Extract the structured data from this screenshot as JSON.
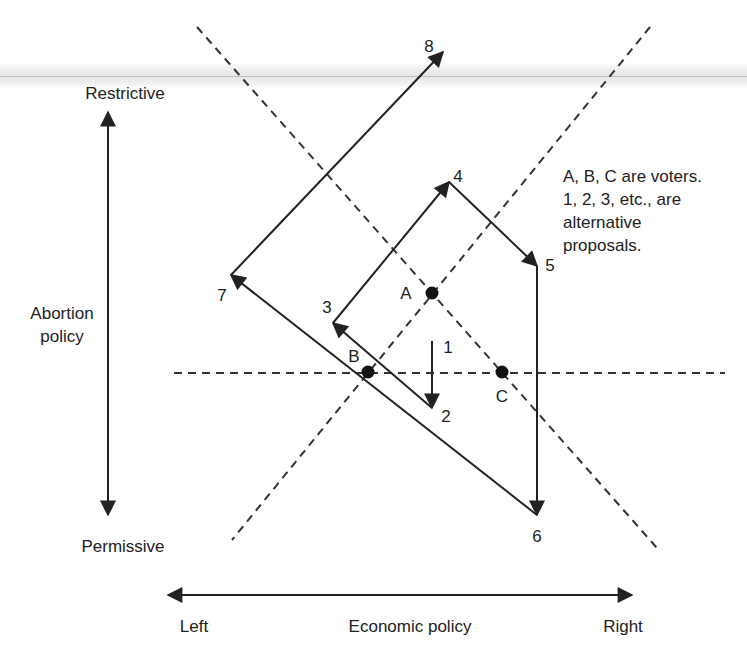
{
  "diagram": {
    "type": "spatial-voting-diagram",
    "axes": {
      "vertical": {
        "label_line1": "Abortion",
        "label_line2": "policy",
        "top_label": "Restrictive",
        "bottom_label": "Permissive"
      },
      "horizontal": {
        "label": "Economic policy",
        "left_label": "Left",
        "right_label": "Right"
      }
    },
    "voters": [
      {
        "name": "A",
        "x": 432,
        "y": 293
      },
      {
        "name": "B",
        "x": 368,
        "y": 372
      },
      {
        "name": "C",
        "x": 502,
        "y": 372
      }
    ],
    "proposals": [
      {
        "label": "1",
        "x": 432,
        "y": 341
      },
      {
        "label": "2",
        "x": 432,
        "y": 408
      },
      {
        "label": "3",
        "x": 333,
        "y": 323
      },
      {
        "label": "4",
        "x": 449,
        "y": 182
      },
      {
        "label": "5",
        "x": 537,
        "y": 266
      },
      {
        "label": "6",
        "x": 537,
        "y": 515
      },
      {
        "label": "7",
        "x": 231,
        "y": 275
      },
      {
        "label": "8",
        "x": 443,
        "y": 52
      }
    ],
    "path": [
      "1",
      "2",
      "3",
      "4",
      "5",
      "6",
      "7",
      "8"
    ],
    "note": {
      "line1": "A, B, C are voters.",
      "line2": "1, 2, 3, etc., are",
      "line3": "alternative",
      "line4": "proposals."
    },
    "colors": {
      "ink": "#222222",
      "background": "#ffffff",
      "band": "#e6e6e6"
    }
  }
}
